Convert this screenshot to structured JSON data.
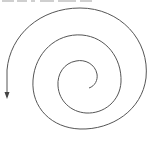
{
  "diagram": {
    "type": "spiral",
    "stroke_color": "#555555",
    "background_color": "#ffffff",
    "arrowhead": "arrow-down",
    "top_text": "",
    "turns": 3
  }
}
